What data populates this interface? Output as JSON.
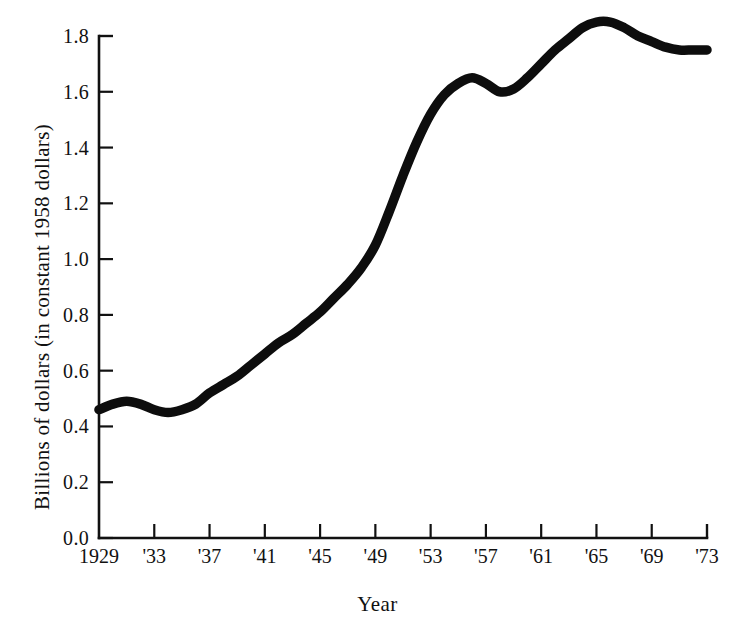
{
  "chart_data": {
    "type": "line",
    "title": "",
    "xlabel": "Year",
    "ylabel": "Billions of dollars (in constant 1958 dollars)",
    "xlim": [
      1929,
      1973
    ],
    "ylim": [
      0.0,
      1.8
    ],
    "grid": false,
    "legend": "none",
    "series_name": "Billions of dollars (in constant 1958 dollars)",
    "line_color": "#0d0d0d",
    "x_tick_labels": [
      "1929",
      "'33",
      "'37",
      "'41",
      "'45",
      "'49",
      "'53",
      "'57",
      "'61",
      "'65",
      "'69",
      "'73"
    ],
    "x_tick_values": [
      1929,
      1933,
      1937,
      1941,
      1945,
      1949,
      1953,
      1957,
      1961,
      1965,
      1969,
      1973
    ],
    "y_tick_labels": [
      "0.0",
      "0.2",
      "0.4",
      "0.6",
      "0.8",
      "1.0",
      "1.2",
      "1.4",
      "1.6",
      "1.8"
    ],
    "y_tick_values": [
      0.0,
      0.2,
      0.4,
      0.6,
      0.8,
      1.0,
      1.2,
      1.4,
      1.6,
      1.8
    ],
    "x": [
      1929,
      1930,
      1931,
      1932,
      1933,
      1934,
      1935,
      1936,
      1937,
      1938,
      1939,
      1940,
      1941,
      1942,
      1943,
      1944,
      1945,
      1946,
      1947,
      1948,
      1949,
      1950,
      1951,
      1952,
      1953,
      1954,
      1955,
      1956,
      1957,
      1958,
      1959,
      1960,
      1961,
      1962,
      1963,
      1964,
      1965,
      1966,
      1967,
      1968,
      1969,
      1970,
      1971,
      1972,
      1973
    ],
    "values": [
      0.46,
      0.48,
      0.49,
      0.48,
      0.46,
      0.45,
      0.46,
      0.48,
      0.52,
      0.55,
      0.58,
      0.62,
      0.66,
      0.7,
      0.73,
      0.77,
      0.81,
      0.86,
      0.91,
      0.97,
      1.05,
      1.17,
      1.3,
      1.42,
      1.52,
      1.59,
      1.63,
      1.65,
      1.63,
      1.6,
      1.61,
      1.65,
      1.7,
      1.75,
      1.79,
      1.83,
      1.85,
      1.85,
      1.83,
      1.8,
      1.78,
      1.76,
      1.75,
      1.75,
      1.75
    ]
  }
}
